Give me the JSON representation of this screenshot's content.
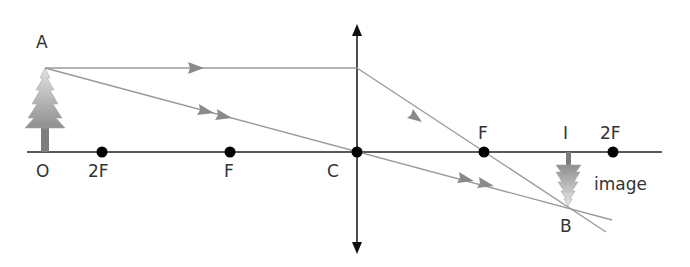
{
  "diagram": {
    "labels": {
      "top_of_object": "A",
      "object_base": "O",
      "left_2f": "2F",
      "left_f": "F",
      "optical_center": "C",
      "right_f": "F",
      "image_base": "I",
      "right_2f": "2F",
      "image_tip": "B",
      "image_caption": "image"
    },
    "geometry": {
      "principal_axis_y": 152,
      "lens_x": 357,
      "points_x": {
        "O": 45,
        "2F_left": 102,
        "F_left": 230,
        "C": 357,
        "F_right": 484,
        "2F_right": 613
      },
      "A": [
        45,
        68
      ],
      "B": [
        568,
        206
      ]
    },
    "colors": {
      "axis": "#222222",
      "ray": "#999999",
      "arrowhead": "#888888",
      "tree": "#9a9a9a",
      "point": "#000000"
    }
  }
}
